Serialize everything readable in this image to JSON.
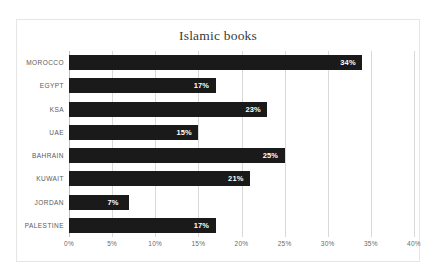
{
  "chart_data": {
    "type": "bar",
    "orientation": "horizontal",
    "title": "Islamic books",
    "xlabel": "",
    "ylabel": "",
    "categories": [
      "MOROCCO",
      "EGYPT",
      "KSA",
      "UAE",
      "BAHRAIN",
      "KUWAIT",
      "JORDAN",
      "PALESTINE"
    ],
    "values": [
      34,
      17,
      23,
      15,
      25,
      21,
      7,
      17
    ],
    "data_labels": [
      "34%",
      "17%",
      "23%",
      "15%",
      "25%",
      "21%",
      "7%",
      "17%"
    ],
    "xlim": [
      0,
      40
    ],
    "xticks": [
      0,
      5,
      10,
      15,
      20,
      25,
      30,
      35,
      40
    ],
    "xtick_labels": [
      "0%",
      "5%",
      "10%",
      "15%",
      "20%",
      "25%",
      "30%",
      "35%",
      "40%"
    ],
    "grid": "vertical",
    "legend": "none",
    "bar_color": "#1a1a1a",
    "label_color": "#ffffff",
    "gridline_color": "#d9d9d9",
    "plot_background": "#ffffff",
    "frame_border_color": "#e6e6e6"
  }
}
